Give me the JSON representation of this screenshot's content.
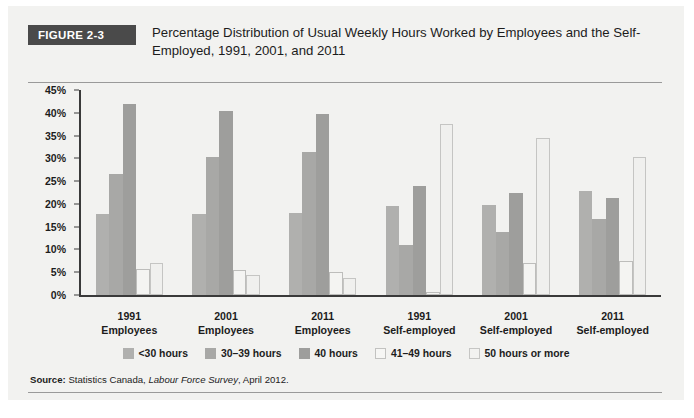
{
  "figure": {
    "badge": "FIGURE 2-3",
    "title": "Percentage Distribution of Usual Weekly Hours Worked by Employees and the Self-Employed, 1991, 2001, and 2011",
    "source_label": "Source:",
    "source_text": "Statistics Canada,",
    "source_italic": "Labour Force Survey",
    "source_tail": ", April 2012."
  },
  "chart_data": {
    "type": "bar",
    "title": "Percentage Distribution of Usual Weekly Hours Worked by Employees and the Self-Employed, 1991, 2001, and 2011",
    "xlabel": "",
    "ylabel": "",
    "ylim": [
      0,
      45
    ],
    "ytick_labels": [
      "0%",
      "5%",
      "10%",
      "15%",
      "20%",
      "25%",
      "30%",
      "35%",
      "40%",
      "45%"
    ],
    "ytick_values": [
      0,
      5,
      10,
      15,
      20,
      25,
      30,
      35,
      40,
      45
    ],
    "grid": false,
    "legend_position": "bottom",
    "categories": [
      {
        "year": "1991",
        "class": "Employees"
      },
      {
        "year": "2001",
        "class": "Employees"
      },
      {
        "year": "2011",
        "class": "Employees"
      },
      {
        "year": "1991",
        "class": "Self-employed"
      },
      {
        "year": "2001",
        "class": "Self-employed"
      },
      {
        "year": "2011",
        "class": "Self-employed"
      }
    ],
    "series": [
      {
        "name": "<30 hours",
        "color": "#b0b0ae",
        "values": [
          17.7,
          17.7,
          18.0,
          19.5,
          19.8,
          22.8
        ]
      },
      {
        "name": "30–39 hours",
        "color": "#a8a8a6",
        "values": [
          26.5,
          30.3,
          31.5,
          11.0,
          13.8,
          16.7
        ]
      },
      {
        "name": "40 hours",
        "color": "#9e9e9c",
        "values": [
          42.0,
          40.3,
          39.8,
          24.0,
          22.5,
          21.3
        ]
      },
      {
        "name": "41–49 hours",
        "color": "#f4f4f2",
        "values": [
          5.7,
          5.5,
          5.0,
          0.6,
          7.0,
          7.5
        ]
      },
      {
        "name": "50 hours or more",
        "color": "#f0f0ee",
        "values": [
          7.0,
          4.5,
          3.8,
          37.5,
          34.5,
          30.3
        ]
      }
    ]
  }
}
